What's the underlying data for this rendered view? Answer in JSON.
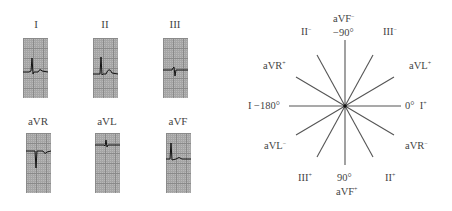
{
  "leads": [
    {
      "id": "I",
      "label": "I",
      "trace": "M0,34 L6,34 L8,33 L9,20 L10,36 L11,34 L15,34 Q17,30 19,33 L25,34"
    },
    {
      "id": "II",
      "label": "II",
      "trace": "M0,36 L6,36 L7,36 L8,19 L9,37 L10,36 L13,36 Q16,28 19,35 L25,36"
    },
    {
      "id": "III",
      "label": "III",
      "trace": "M0,32 L9,32 L10,30 L11,29 L12,38 L13,32 L25,32"
    },
    {
      "id": "aVR",
      "label": "aVR",
      "trace": "M0,18 L8,18 L9,18 L10,35 L11,18 L17,18 Q19,22 21,19 L25,18"
    },
    {
      "id": "aVL",
      "label": "aVL",
      "trace": "M0,12 L9,12 L10,13 L11,7 L12,14 L13,12 L25,12"
    },
    {
      "id": "aVF",
      "label": "aVF",
      "trace": "M0,26 L3,26 L4,26 L5,10 L6,27 L10,26 Q13,23 16,26 L25,26"
    }
  ],
  "hexaxial": {
    "center": [
      345,
      106
    ],
    "labels": {
      "top_lead": "aVF",
      "top_sign": "−",
      "top_angle": "−90°",
      "bottom_angle": "90°",
      "bottom_lead": "aVF",
      "bottom_sign": "+",
      "left": "I  −180°",
      "right_angle": "0°",
      "right_lead": "I",
      "right_sign": "+",
      "upper_left_lead": "II",
      "upper_left_sign": "−",
      "upper_right_lead": "III",
      "upper_right_sign": "−",
      "lower_left_lead": "III",
      "lower_left_sign": "+",
      "lower_right_lead": "II",
      "lower_right_sign": "+",
      "aVR_plus": "aVR",
      "aVR_plus_sign": "+",
      "aVL_plus": "aVL",
      "aVL_plus_sign": "+",
      "aVL_minus": "aVL",
      "aVL_minus_sign": "−",
      "aVR_minus": "aVR",
      "aVR_minus_sign": "−"
    }
  }
}
